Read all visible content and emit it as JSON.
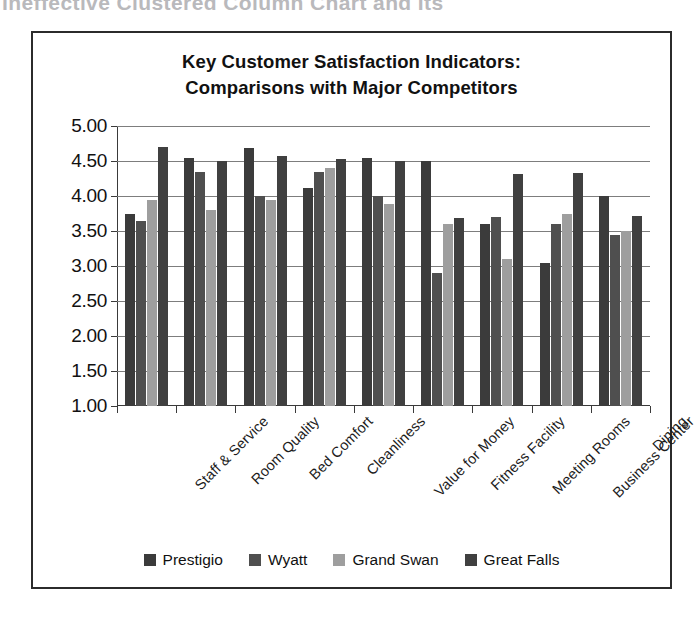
{
  "page": {
    "cut_off_caption": "Ineffective Clustered Column Chart and Its"
  },
  "chart_data": {
    "type": "bar",
    "title": "Key Customer Satisfaction Indicators: Comparisons with Major Competitors",
    "title_line1": "Key Customer Satisfaction Indicators:",
    "title_line2": "Comparisons with Major Competitors",
    "xlabel": "",
    "ylabel": "",
    "ylim": [
      1.0,
      5.0
    ],
    "ytick_step": 0.5,
    "ytick_labels": [
      "5.00",
      "4.50",
      "4.00",
      "3.50",
      "3.00",
      "2.50",
      "2.00",
      "1.50",
      "1.00"
    ],
    "ytick_values": [
      5.0,
      4.5,
      4.0,
      3.5,
      3.0,
      2.5,
      2.0,
      1.5,
      1.0
    ],
    "grid": true,
    "legend_position": "bottom",
    "categories": [
      "Staff & Service",
      "Room Quality",
      "Bed Comfort",
      "Cleanliness",
      "Value for Money",
      "Fitness Facility",
      "Meeting Rooms",
      "Business Center",
      "Dining"
    ],
    "series": [
      {
        "name": "Prestigio",
        "color": "#3b3b3b",
        "values": [
          3.75,
          4.55,
          4.68,
          4.12,
          4.55,
          4.5,
          3.6,
          3.05,
          4.0
        ]
      },
      {
        "name": "Wyatt",
        "color": "#4f4f4f",
        "values": [
          3.65,
          4.35,
          4.0,
          4.35,
          4.0,
          2.9,
          3.7,
          3.6,
          3.45
        ]
      },
      {
        "name": "Grand Swan",
        "color": "#9e9e9e",
        "values": [
          3.95,
          3.8,
          3.95,
          4.4,
          3.88,
          3.6,
          3.1,
          3.75,
          3.5
        ]
      },
      {
        "name": "Great Falls",
        "color": "#404040",
        "values": [
          4.7,
          4.5,
          4.57,
          4.53,
          4.5,
          3.68,
          4.32,
          4.33,
          3.72
        ]
      }
    ]
  }
}
